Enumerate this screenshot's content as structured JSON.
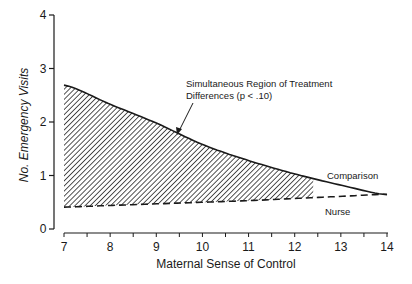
{
  "chart_data": {
    "type": "line",
    "title": "",
    "xlabel": "Maternal Sense of Control",
    "ylabel": "No. Emergency Visits",
    "xlim": [
      7,
      14
    ],
    "ylim": [
      0,
      4
    ],
    "x_ticks": [
      "7",
      "8",
      "9",
      "10",
      "11",
      "12",
      "13",
      "14"
    ],
    "y_ticks": [
      "0",
      "1",
      "2",
      "3",
      "4"
    ],
    "grid": false,
    "x": [
      7,
      8,
      9,
      10,
      11,
      12,
      13,
      14
    ],
    "series": [
      {
        "name": "Comparison",
        "style": "solid",
        "values": [
          2.69,
          2.33,
          1.98,
          1.58,
          1.28,
          1.03,
          0.82,
          0.64
        ]
      },
      {
        "name": "Nurse",
        "style": "dashed",
        "values": [
          0.41,
          0.44,
          0.47,
          0.5,
          0.53,
          0.57,
          0.61,
          0.65
        ]
      }
    ],
    "shaded_region": {
      "x_start": 7,
      "x_end": 12.4,
      "pattern": "diagonal-hatch",
      "between": [
        "Nurse",
        "Comparison"
      ]
    },
    "annotations": [
      {
        "text_line1": "Simultaneous Region of Treatment",
        "text_line2": "Differences (p < .10)",
        "points_to": [
          9.5,
          1.5
        ]
      }
    ]
  }
}
